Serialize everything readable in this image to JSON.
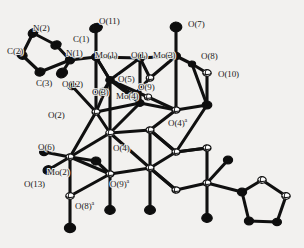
{
  "figure": {
    "kind": "ortep-crystal-structure",
    "background_color": "#f2f1ef",
    "line_color": "#101010",
    "atom_fill_dark": "#0d0d0d",
    "atom_fill_light": "#ffffff",
    "width": 304,
    "height": 248
  },
  "labels": [
    {
      "id": "N2",
      "text": "N(2)",
      "x": 33,
      "y": 24
    },
    {
      "id": "C1",
      "text": "C(1)",
      "x": 73,
      "y": 35
    },
    {
      "id": "O11",
      "text": "O(11)",
      "x": 99,
      "y": 17
    },
    {
      "id": "O7",
      "text": "O(7)",
      "x": 188,
      "y": 20
    },
    {
      "id": "C2",
      "text": "C(2)",
      "x": 7,
      "y": 47
    },
    {
      "id": "N1",
      "text": "N(1)",
      "x": 66,
      "y": 49
    },
    {
      "id": "Mo1",
      "text": "Mo(1)",
      "x": 95,
      "y": 51
    },
    {
      "id": "O1",
      "text": "O(1)",
      "x": 131,
      "y": 51
    },
    {
      "id": "Mo3",
      "text": "Mo(3)",
      "x": 153,
      "y": 51
    },
    {
      "id": "O8",
      "text": "O(8)",
      "x": 201,
      "y": 52
    },
    {
      "id": "C3",
      "text": "C(3)",
      "x": 36,
      "y": 79
    },
    {
      "id": "O12",
      "text": "O(12)",
      "x": 62,
      "y": 80
    },
    {
      "id": "O5",
      "text": "O(5)",
      "x": 118,
      "y": 75
    },
    {
      "id": "O10",
      "text": "O(10)",
      "x": 218,
      "y": 70
    },
    {
      "id": "O3",
      "text": "O(3)",
      "x": 92,
      "y": 88
    },
    {
      "id": "O9",
      "text": "O(9)",
      "x": 138,
      "y": 83
    },
    {
      "id": "Mo4",
      "text": "Mo(4)",
      "x": 116,
      "y": 92
    },
    {
      "id": "O2",
      "text": "O(2)",
      "x": 48,
      "y": 111
    },
    {
      "id": "O4a",
      "text": "O(4)",
      "sup": "a",
      "x": 168,
      "y": 119
    },
    {
      "id": "O6",
      "text": "O(6)",
      "x": 38,
      "y": 143
    },
    {
      "id": "O4",
      "text": "O(4)",
      "x": 113,
      "y": 144
    },
    {
      "id": "Mo2",
      "text": "Mo(2)",
      "x": 47,
      "y": 168
    },
    {
      "id": "O13",
      "text": "O(13)",
      "x": 24,
      "y": 180
    },
    {
      "id": "O9a",
      "text": "O(9)",
      "sup": "a",
      "x": 110,
      "y": 180
    },
    {
      "id": "O8a",
      "text": "O(8)",
      "sup": "a",
      "x": 75,
      "y": 202
    }
  ],
  "bonds": [
    [
      96,
      57,
      70,
      60
    ],
    [
      70,
      60,
      56,
      45
    ],
    [
      56,
      45,
      33,
      33
    ],
    [
      33,
      33,
      22,
      55
    ],
    [
      22,
      55,
      40,
      72
    ],
    [
      40,
      72,
      70,
      60
    ],
    [
      70,
      60,
      62,
      73
    ],
    [
      96,
      57,
      96,
      28
    ],
    [
      96,
      57,
      140,
      58
    ],
    [
      140,
      58,
      176,
      56
    ],
    [
      176,
      56,
      176,
      27
    ],
    [
      176,
      56,
      192,
      64
    ],
    [
      192,
      64,
      207,
      73
    ],
    [
      176,
      56,
      150,
      78
    ],
    [
      150,
      78,
      140,
      58
    ],
    [
      96,
      57,
      110,
      80
    ],
    [
      110,
      80,
      140,
      58
    ],
    [
      110,
      80,
      96,
      57
    ],
    [
      96,
      57,
      96,
      112
    ],
    [
      140,
      58,
      140,
      103
    ],
    [
      176,
      56,
      176,
      110
    ],
    [
      110,
      80,
      110,
      133
    ],
    [
      96,
      112,
      110,
      80
    ],
    [
      110,
      80,
      134,
      95
    ],
    [
      134,
      95,
      150,
      78
    ],
    [
      110,
      80,
      103,
      92
    ],
    [
      96,
      112,
      72,
      86
    ],
    [
      110,
      80,
      148,
      97
    ],
    [
      148,
      97,
      176,
      110
    ],
    [
      140,
      103,
      110,
      80
    ],
    [
      140,
      103,
      176,
      110
    ],
    [
      140,
      103,
      96,
      112
    ],
    [
      140,
      103,
      110,
      133
    ],
    [
      96,
      112,
      110,
      133
    ],
    [
      176,
      110,
      207,
      105
    ],
    [
      207,
      73,
      207,
      105
    ],
    [
      192,
      64,
      207,
      105
    ],
    [
      110,
      133,
      70,
      157
    ],
    [
      96,
      112,
      70,
      157
    ],
    [
      70,
      157,
      44,
      152
    ],
    [
      70,
      157,
      48,
      170
    ],
    [
      70,
      157,
      70,
      196
    ],
    [
      110,
      133,
      150,
      130
    ],
    [
      150,
      130,
      176,
      110
    ],
    [
      150,
      130,
      176,
      152
    ],
    [
      110,
      133,
      150,
      168
    ],
    [
      150,
      168,
      150,
      130
    ],
    [
      150,
      168,
      110,
      174
    ],
    [
      110,
      174,
      110,
      133
    ],
    [
      110,
      174,
      96,
      161
    ],
    [
      110,
      174,
      70,
      196
    ],
    [
      70,
      157,
      110,
      174
    ],
    [
      150,
      168,
      176,
      152
    ],
    [
      176,
      152,
      207,
      105
    ],
    [
      176,
      152,
      207,
      148
    ],
    [
      150,
      168,
      150,
      210
    ],
    [
      110,
      174,
      110,
      210
    ],
    [
      70,
      196,
      70,
      228
    ],
    [
      150,
      168,
      176,
      190
    ],
    [
      176,
      190,
      150,
      168
    ],
    [
      176,
      190,
      207,
      183
    ],
    [
      207,
      148,
      207,
      183
    ],
    [
      207,
      183,
      228,
      160
    ],
    [
      207,
      183,
      242,
      192
    ],
    [
      207,
      183,
      207,
      218
    ],
    [
      242,
      192,
      262,
      180
    ],
    [
      262,
      180,
      286,
      196
    ],
    [
      286,
      196,
      277,
      222
    ],
    [
      277,
      222,
      249,
      221
    ],
    [
      249,
      221,
      242,
      192
    ],
    [
      176,
      152,
      207,
      148
    ],
    [
      150,
      130,
      176,
      152
    ],
    [
      96,
      161,
      70,
      157
    ]
  ],
  "atoms_dark": [
    [
      33,
      33,
      5.0,
      4.0,
      -30
    ],
    [
      22,
      55,
      5.2,
      4.2,
      20
    ],
    [
      40,
      72,
      5.0,
      4.0,
      -10
    ],
    [
      56,
      45,
      5.2,
      4.0,
      -20
    ],
    [
      70,
      60,
      4.6,
      3.8,
      0
    ],
    [
      62,
      73,
      5.6,
      4.6,
      -25
    ],
    [
      96,
      28,
      6.4,
      4.4,
      -15
    ],
    [
      176,
      27,
      5.8,
      4.8,
      0
    ],
    [
      96,
      57,
      4.4,
      3.6,
      0
    ],
    [
      140,
      58,
      4.6,
      3.6,
      0
    ],
    [
      176,
      56,
      4.4,
      3.6,
      0
    ],
    [
      192,
      64,
      3.6,
      3.0,
      0
    ],
    [
      110,
      80,
      4.2,
      3.4,
      0
    ],
    [
      103,
      92,
      4.4,
      3.6,
      0
    ],
    [
      72,
      86,
      4.4,
      3.6,
      0
    ],
    [
      96,
      161,
      4.8,
      4.0,
      0
    ],
    [
      48,
      170,
      5.0,
      4.2,
      -20
    ],
    [
      44,
      152,
      4.4,
      3.6,
      0
    ],
    [
      70,
      228,
      5.6,
      4.6,
      0
    ],
    [
      110,
      210,
      5.2,
      4.4,
      0
    ],
    [
      150,
      210,
      5.4,
      4.4,
      0
    ],
    [
      207,
      218,
      5.2,
      4.4,
      0
    ],
    [
      228,
      160,
      4.6,
      3.8,
      0
    ],
    [
      242,
      192,
      4.6,
      3.8,
      0
    ],
    [
      249,
      221,
      4.6,
      3.8,
      0
    ],
    [
      277,
      222,
      4.4,
      3.6,
      0
    ],
    [
      207,
      105,
      4.8,
      4.0,
      0
    ],
    [
      140,
      103,
      4.0,
      3.4,
      0
    ]
  ],
  "atoms_light": [
    [
      110,
      133,
      4.2,
      3.4,
      0
    ],
    [
      96,
      112,
      4.0,
      3.2,
      0
    ],
    [
      150,
      130,
      4.0,
      3.2,
      0
    ],
    [
      176,
      110,
      4.0,
      3.2,
      0
    ],
    [
      150,
      168,
      4.0,
      3.2,
      0
    ],
    [
      110,
      174,
      4.0,
      3.2,
      0
    ],
    [
      70,
      196,
      4.2,
      3.4,
      0
    ],
    [
      176,
      152,
      4.0,
      3.2,
      0
    ],
    [
      207,
      148,
      4.0,
      3.2,
      0
    ],
    [
      207,
      183,
      4.0,
      3.2,
      0
    ],
    [
      207,
      73,
      4.2,
      3.4,
      0
    ],
    [
      150,
      78,
      3.8,
      3.2,
      0
    ],
    [
      134,
      95,
      3.8,
      3.2,
      0
    ],
    [
      148,
      97,
      3.6,
      3.0,
      0
    ],
    [
      70,
      157,
      4.0,
      3.2,
      0
    ],
    [
      176,
      190,
      4.0,
      3.2,
      0
    ],
    [
      262,
      180,
      4.2,
      3.4,
      0
    ],
    [
      286,
      196,
      4.2,
      3.4,
      0
    ]
  ]
}
